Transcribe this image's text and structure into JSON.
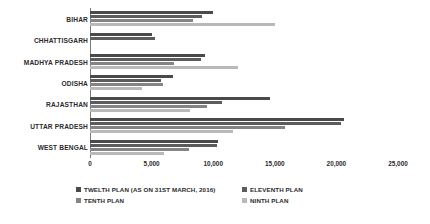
{
  "chart_data": {
    "type": "bar",
    "orientation": "horizontal",
    "title": "",
    "xlabel": "",
    "ylabel": "",
    "xlim": [
      0,
      25000
    ],
    "xticks": [
      "0",
      "5,000",
      "10,000",
      "15,000",
      "20,000",
      "25,000"
    ],
    "xtick_values": [
      0,
      5000,
      10000,
      15000,
      20000,
      25000
    ],
    "grid": false,
    "legend_position": "bottom",
    "categories": [
      "BIHAR",
      "CHHATTISGARH",
      "MADHYA PRADESH",
      "ODISHA",
      "RAJASTHAN",
      "UTTAR PRADESH",
      "WEST BENGAL"
    ],
    "series": [
      {
        "name": "TWELTH PLAN (AS ON 31ST MARCH, 2016)",
        "color": "#4a4a4a",
        "values": [
          10000,
          5000,
          9300,
          6700,
          14600,
          20600,
          10400
        ]
      },
      {
        "name": "ELEVENTH PLAN",
        "color": "#5c5c5c",
        "values": [
          9100,
          5300,
          9000,
          5800,
          10700,
          20400,
          10300
        ]
      },
      {
        "name": "TENTH PLAN",
        "color": "#848484",
        "values": [
          8400,
          0,
          6800,
          5900,
          9500,
          15800,
          8000
        ]
      },
      {
        "name": "NINTH PLAN",
        "color": "#b9b9b9",
        "values": [
          15000,
          0,
          12000,
          4200,
          8100,
          11600,
          6000
        ]
      }
    ]
  },
  "legend": {
    "items": [
      {
        "label": "TWELTH PLAN (AS ON 31ST MARCH, 2016)",
        "color": "#4a4a4a"
      },
      {
        "label": "ELEVENTH PLAN",
        "color": "#5c5c5c"
      },
      {
        "label": "TENTH PLAN",
        "color": "#848484"
      },
      {
        "label": "NINTH PLAN",
        "color": "#b9b9b9"
      }
    ]
  }
}
